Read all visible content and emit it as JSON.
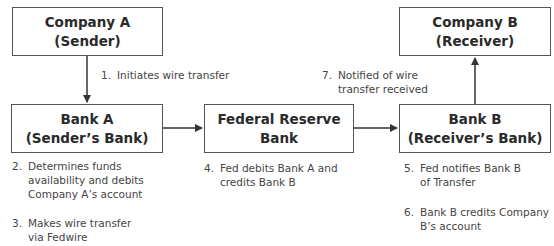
{
  "boxes": {
    "company_a": {
      "line1": "Company A",
      "line2": "(Sender)"
    },
    "bank_a": {
      "line1": "Bank A",
      "line2": "(Sender’s Bank)"
    },
    "fed": {
      "line1": "Federal Reserve",
      "line2": "Bank"
    },
    "bank_b": {
      "line1": "Bank B",
      "line2": "(Receiver’s Bank)"
    },
    "company_b": {
      "line1": "Company B",
      "line2": "(Receiver)"
    }
  },
  "steps": [
    {
      "num": "1.",
      "lines": [
        "Initiates wire transfer"
      ]
    },
    {
      "num": "2.",
      "lines": [
        "Determines funds",
        "availability and debits",
        "Company A’s account"
      ]
    },
    {
      "num": "3.",
      "lines": [
        "Makes wire transfer",
        "via Fedwire"
      ]
    },
    {
      "num": "4.",
      "lines": [
        "Fed debits Bank A and",
        "credits Bank B"
      ]
    },
    {
      "num": "5.",
      "lines": [
        "Fed notifies Bank B",
        "of Transfer"
      ]
    },
    {
      "num": "6.",
      "lines": [
        "Bank B credits Company",
        "B’s account"
      ]
    },
    {
      "num": "7.",
      "lines": [
        "Notified of wire",
        "transfer received"
      ]
    }
  ]
}
